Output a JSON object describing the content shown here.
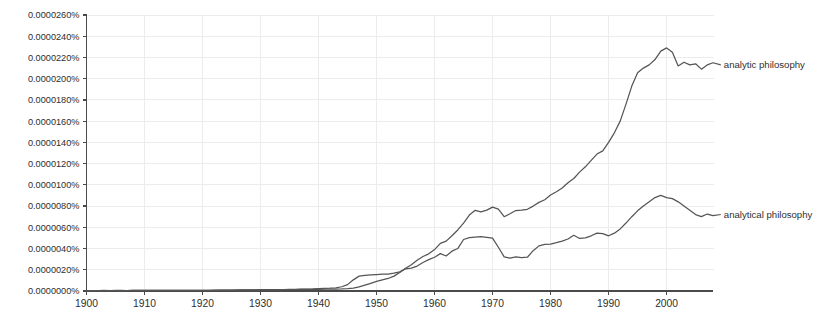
{
  "chart_data": {
    "type": "line",
    "title": "",
    "subtitle": "",
    "xlabel": "",
    "ylabel": "",
    "xlim": [
      1900,
      2008
    ],
    "ylim": [
      0.0,
      2.6e-05
    ],
    "grid": true,
    "legend_position": "right-inline-annotation",
    "y_unit": "%",
    "y_tick_labels": [
      "0.0000260%",
      "0.0000240%",
      "0.0000220%",
      "0.0000200%",
      "0.0000180%",
      "0.0000160%",
      "0.0000140%",
      "0.0000120%",
      "0.0000100%",
      "0.0000080%",
      "0.0000060%",
      "0.0000040%",
      "0.0000020%",
      "0.0000000%"
    ],
    "y_tick_values": [
      2.6e-05,
      2.4e-05,
      2.2e-05,
      2e-05,
      1.8e-05,
      1.6e-05,
      1.4e-05,
      1.2e-05,
      1e-05,
      8e-06,
      6e-06,
      4e-06,
      2e-06,
      0.0
    ],
    "x_tick_labels": [
      "1900",
      "1910",
      "1920",
      "1930",
      "1940",
      "1950",
      "1960",
      "1970",
      "1980",
      "1990",
      "2000"
    ],
    "x_tick_values": [
      1900,
      1910,
      1920,
      1930,
      1940,
      1950,
      1960,
      1970,
      1980,
      1990,
      2000
    ],
    "x": [
      1900,
      1901,
      1902,
      1903,
      1904,
      1905,
      1906,
      1907,
      1908,
      1909,
      1910,
      1911,
      1912,
      1913,
      1914,
      1915,
      1916,
      1917,
      1918,
      1919,
      1920,
      1921,
      1922,
      1923,
      1924,
      1925,
      1926,
      1927,
      1928,
      1929,
      1930,
      1931,
      1932,
      1933,
      1934,
      1935,
      1936,
      1937,
      1938,
      1939,
      1940,
      1941,
      1942,
      1943,
      1944,
      1945,
      1946,
      1947,
      1948,
      1949,
      1950,
      1951,
      1952,
      1953,
      1954,
      1955,
      1956,
      1957,
      1958,
      1959,
      1960,
      1961,
      1962,
      1963,
      1964,
      1965,
      1966,
      1967,
      1968,
      1969,
      1970,
      1971,
      1972,
      1973,
      1974,
      1975,
      1976,
      1977,
      1978,
      1979,
      1980,
      1981,
      1982,
      1983,
      1984,
      1985,
      1986,
      1987,
      1988,
      1989,
      1990,
      1991,
      1992,
      1993,
      1994,
      1995,
      1996,
      1997,
      1998,
      1999,
      2000,
      2001,
      2002,
      2003,
      2004,
      2005,
      2006,
      2007,
      2008
    ],
    "series": [
      {
        "name": "analytic philosophy",
        "color": "#555555",
        "label_x": 2009,
        "label_y": 2.13e-05,
        "values": [
          4e-08,
          4e-08,
          4e-08,
          5e-08,
          4e-08,
          5e-08,
          5e-08,
          4e-08,
          5e-08,
          5e-08,
          6e-08,
          5e-08,
          6e-08,
          6e-08,
          5e-08,
          6e-08,
          5e-08,
          5e-08,
          5e-08,
          6e-08,
          7e-08,
          7e-08,
          7e-08,
          8e-08,
          8e-08,
          9e-08,
          9e-08,
          1e-07,
          1e-07,
          1.1e-07,
          1.1e-07,
          1.2e-07,
          1.2e-07,
          1.3e-07,
          1.3e-07,
          1.4e-07,
          1.4e-07,
          1.5e-07,
          1.5e-07,
          1.6e-07,
          1.6e-07,
          1.7e-07,
          1.7e-07,
          1.8e-07,
          1.9e-07,
          2.2e-07,
          2.8e-07,
          3.8e-07,
          5.5e-07,
          7.2e-07,
          9e-07,
          1.05e-06,
          1.18e-06,
          1.4e-06,
          1.75e-06,
          2.15e-06,
          2.48e-06,
          2.9e-06,
          3.25e-06,
          3.5e-06,
          3.9e-06,
          4.48e-06,
          4.7e-06,
          5.2e-06,
          5.75e-06,
          6.4e-06,
          7.15e-06,
          7.6e-06,
          7.45e-06,
          7.62e-06,
          7.9e-06,
          7.72e-06,
          7e-06,
          7.28e-06,
          7.58e-06,
          7.62e-06,
          7.7e-06,
          8e-06,
          8.35e-06,
          8.6e-06,
          9.05e-06,
          9.35e-06,
          9.7e-06,
          1.02e-05,
          1.06e-05,
          1.12e-05,
          1.17e-05,
          1.23e-05,
          1.29e-05,
          1.32e-05,
          1.4e-05,
          1.49e-05,
          1.6e-05,
          1.76e-05,
          1.93e-05,
          2.055e-05,
          2.1e-05,
          2.13e-05,
          2.18e-05,
          2.26e-05,
          2.29e-05,
          2.25e-05,
          2.12e-05,
          2.155e-05,
          2.13e-05,
          2.14e-05,
          2.09e-05,
          2.13e-05,
          2.15e-05
        ]
      },
      {
        "name": "analytical philosophy",
        "color": "#555555",
        "label_x": 2009,
        "label_y": 7.2e-06,
        "values": [
          3e-08,
          3e-08,
          3e-08,
          4e-08,
          4e-08,
          4e-08,
          4e-08,
          4e-08,
          5e-08,
          5e-08,
          6e-08,
          6e-08,
          6e-08,
          6e-08,
          6e-08,
          6e-08,
          6e-08,
          5e-08,
          6e-08,
          6e-08,
          7e-08,
          7e-08,
          8e-08,
          8e-08,
          9e-08,
          9e-08,
          1e-07,
          1e-07,
          1.1e-07,
          1.1e-07,
          1.2e-07,
          1.2e-07,
          1.3e-07,
          1.4e-07,
          1.4e-07,
          1.5e-07,
          1.6e-07,
          1.7e-07,
          1.8e-07,
          1.9e-07,
          2.2e-07,
          2.4e-07,
          2.6e-07,
          3e-07,
          4e-07,
          6e-07,
          1.05e-06,
          1.4e-06,
          1.48e-06,
          1.52e-06,
          1.55e-06,
          1.58e-06,
          1.6e-06,
          1.68e-06,
          1.8e-06,
          2.08e-06,
          2.15e-06,
          2.35e-06,
          2.68e-06,
          2.95e-06,
          3.18e-06,
          3.52e-06,
          3.3e-06,
          3.75e-06,
          4e-06,
          4.85e-06,
          5.02e-06,
          5.08e-06,
          5.12e-06,
          5.05e-06,
          4.98e-06,
          4.12e-06,
          3.22e-06,
          3.1e-06,
          3.22e-06,
          3.15e-06,
          3.18e-06,
          3.8e-06,
          4.25e-06,
          4.4e-06,
          4.42e-06,
          4.55e-06,
          4.7e-06,
          4.9e-06,
          5.25e-06,
          4.95e-06,
          5e-06,
          5.2e-06,
          5.45e-06,
          5.4e-06,
          5.2e-06,
          5.45e-06,
          5.85e-06,
          6.4e-06,
          7e-06,
          7.55e-06,
          8e-06,
          8.4e-06,
          8.8e-06,
          9e-06,
          8.8e-06,
          8.7e-06,
          8.4e-06,
          8e-06,
          7.6e-06,
          7.2e-06,
          7e-06,
          7.25e-06,
          7.1e-06
        ]
      }
    ]
  }
}
